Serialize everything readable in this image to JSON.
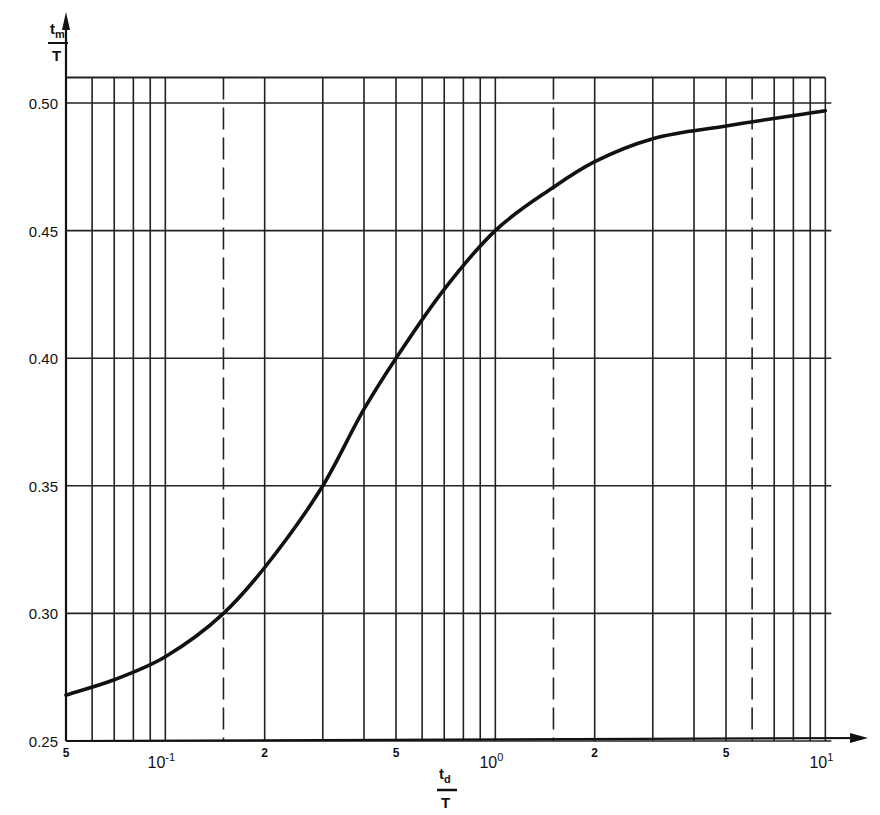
{
  "chart_data": {
    "type": "line",
    "title": "",
    "xlabel": "t_d / T",
    "ylabel": "t_m / T",
    "xscale": "log",
    "xlim": [
      0.05,
      10
    ],
    "ylim": [
      0.25,
      0.51
    ],
    "grid": true,
    "legend": null,
    "y_ticks": [
      {
        "value": 0.25,
        "label": "0.25"
      },
      {
        "value": 0.3,
        "label": "0.30"
      },
      {
        "value": 0.35,
        "label": "0.35"
      },
      {
        "value": 0.4,
        "label": "0.40"
      },
      {
        "value": 0.45,
        "label": "0.45"
      },
      {
        "value": 0.5,
        "label": "0.50"
      }
    ],
    "x_tick_labels": [
      {
        "value": 0.05,
        "label": "5",
        "kind": "minor"
      },
      {
        "value": 0.1,
        "label": "10",
        "exp": "-1",
        "kind": "decade"
      },
      {
        "value": 0.2,
        "label": "2",
        "kind": "minor"
      },
      {
        "value": 0.5,
        "label": "5",
        "kind": "minor"
      },
      {
        "value": 1,
        "label": "10",
        "exp": "0",
        "kind": "decade"
      },
      {
        "value": 2,
        "label": "2",
        "kind": "minor"
      },
      {
        "value": 5,
        "label": "5",
        "kind": "minor"
      },
      {
        "value": 10,
        "label": "10",
        "exp": "1",
        "kind": "decade"
      }
    ],
    "x_gridlines": [
      0.05,
      0.06,
      0.07,
      0.08,
      0.09,
      0.1,
      0.15,
      0.2,
      0.3,
      0.4,
      0.5,
      0.6,
      0.7,
      0.8,
      0.9,
      1,
      1.5,
      2,
      3,
      4,
      5,
      6,
      7,
      8,
      9,
      10
    ],
    "x_dashed_gridlines": [
      0.15,
      1.5,
      6
    ],
    "series": [
      {
        "name": "t_m/T",
        "x": [
          0.05,
          0.07,
          0.1,
          0.15,
          0.2,
          0.3,
          0.4,
          0.5,
          0.7,
          1.0,
          1.5,
          2,
          3,
          5,
          10
        ],
        "y": [
          0.268,
          0.274,
          0.283,
          0.3,
          0.318,
          0.35,
          0.38,
          0.4,
          0.427,
          0.45,
          0.467,
          0.477,
          0.486,
          0.491,
          0.497
        ]
      }
    ]
  },
  "axes": {
    "y_title_num": "t",
    "y_title_sub": "m",
    "y_title_den": "T",
    "x_title_num": "t",
    "x_title_sub": "d",
    "x_title_den": "T"
  }
}
